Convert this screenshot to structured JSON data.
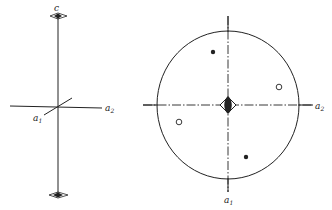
{
  "left_figure": {
    "title": "orthorhombic axes with twofold symmetry",
    "axis_labels": {
      "c": "c",
      "a1": "a",
      "a1_sub": "1",
      "a2": "a",
      "a2_sub": "2"
    },
    "symbols": [
      "twofold-axis-top",
      "twofold-axis-bottom"
    ]
  },
  "right_figure": {
    "title": "stereographic projection",
    "axis_labels": {
      "a1": "a",
      "a1_sub": "1",
      "a2": "a",
      "a2_sub": "2"
    },
    "center_symbol": "twofold-axis-with-mirror",
    "points": [
      {
        "type": "filled",
        "x": 213,
        "y": 52
      },
      {
        "type": "filled",
        "x": 246,
        "y": 157
      },
      {
        "type": "open",
        "x": 279,
        "y": 87
      },
      {
        "type": "open",
        "x": 179,
        "y": 122
      }
    ]
  },
  "colors": {
    "ink": "#222222",
    "background": "#ffffff"
  }
}
